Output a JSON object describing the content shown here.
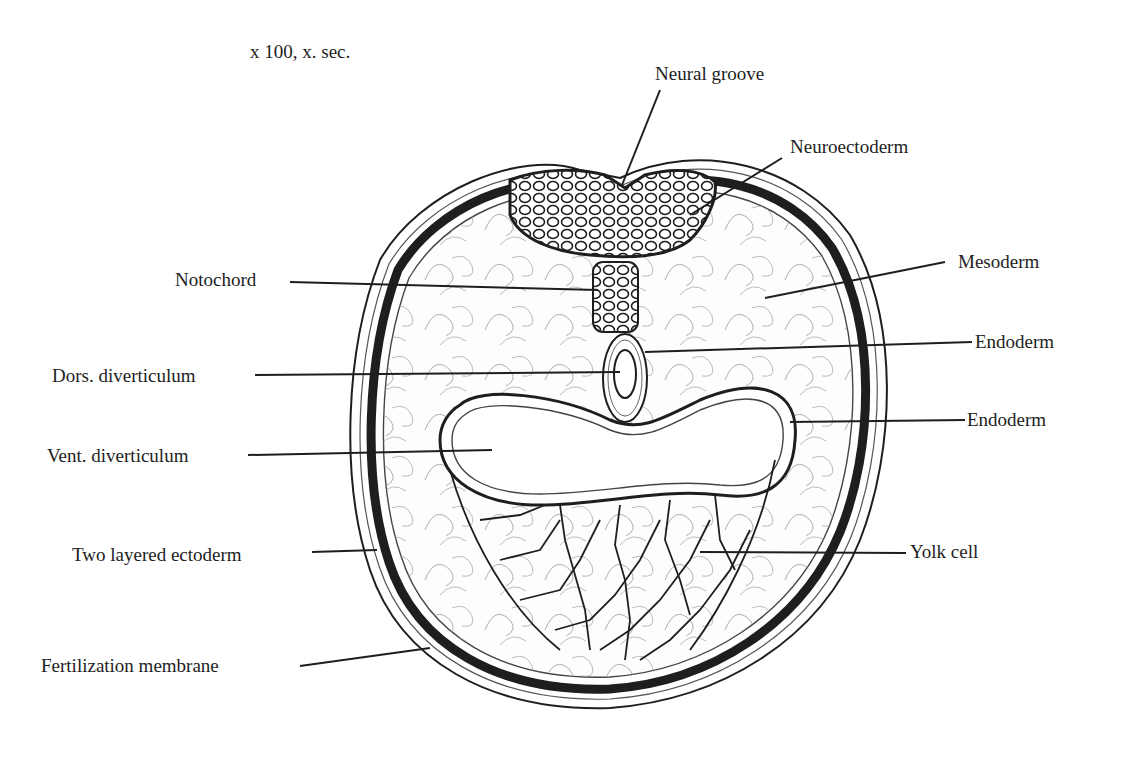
{
  "figure": {
    "magnification": "x 100, x. sec."
  },
  "labels": {
    "neural_groove": "Neural groove",
    "neuroectoderm": "Neuroectoderm",
    "mesoderm": "Mesoderm",
    "notochord": "Notochord",
    "endoderm_upper": "Endoderm",
    "dors_diverticulum": "Dors. diverticulum",
    "endoderm_lower": "Endoderm",
    "vent_diverticulum": "Vent. diverticulum",
    "two_layered_ectoderm": "Two layered ectoderm",
    "yolk_cell": "Yolk cell",
    "fertilization_membrane": "Fertilization membrane"
  },
  "colors": {
    "ink": "#1e1e1e",
    "background": "#ffffff"
  }
}
